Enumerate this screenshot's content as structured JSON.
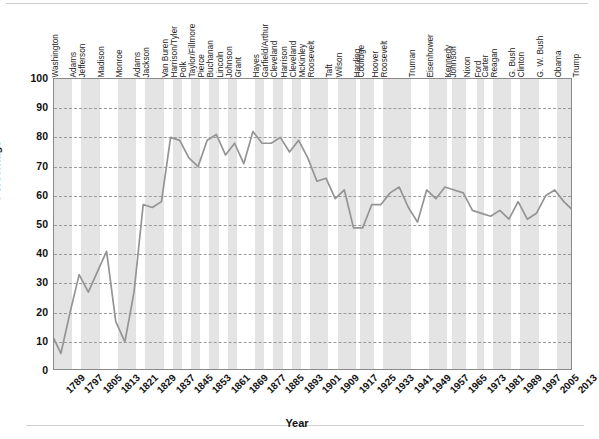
{
  "chart_data": {
    "type": "line",
    "title": "",
    "xlabel": "Year",
    "ylabel": "Percentage",
    "ylim": [
      0,
      100
    ],
    "ytick_step": 10,
    "xlim": [
      1789,
      2016
    ],
    "grid": "horizontal-dashed",
    "legend": "none",
    "line_color": "#949494",
    "band_color": "#e4e4e4",
    "ytick_labels": [
      "100",
      "90",
      "80",
      "70",
      "60",
      "50",
      "40",
      "30",
      "20",
      "10",
      "0"
    ],
    "ytick_values": [
      100,
      90,
      80,
      70,
      60,
      50,
      40,
      30,
      20,
      10,
      0
    ],
    "xtick_labels": [
      "1789",
      "1797",
      "1805",
      "1813",
      "1821",
      "1829",
      "1837",
      "1845",
      "1853",
      "1861",
      "1869",
      "1877",
      "1885",
      "1893",
      "1901",
      "1909",
      "1917",
      "1925",
      "1933",
      "1941",
      "1949",
      "1957",
      "1965",
      "1973",
      "1981",
      "1989",
      "1997",
      "2005",
      "2013"
    ],
    "xtick_values": [
      1789,
      1797,
      1805,
      1813,
      1821,
      1829,
      1837,
      1845,
      1853,
      1861,
      1869,
      1877,
      1885,
      1893,
      1901,
      1909,
      1917,
      1925,
      1933,
      1941,
      1949,
      1957,
      1965,
      1973,
      1981,
      1989,
      1997,
      2005,
      2013
    ],
    "x": [
      1789,
      1792,
      1796,
      1800,
      1804,
      1808,
      1812,
      1816,
      1820,
      1824,
      1828,
      1832,
      1836,
      1840,
      1844,
      1848,
      1852,
      1856,
      1860,
      1864,
      1868,
      1872,
      1876,
      1880,
      1884,
      1888,
      1892,
      1896,
      1900,
      1904,
      1908,
      1912,
      1916,
      1920,
      1924,
      1928,
      1932,
      1936,
      1940,
      1944,
      1948,
      1952,
      1956,
      1960,
      1964,
      1968,
      1972,
      1976,
      1980,
      1984,
      1988,
      1992,
      1996,
      2000,
      2004,
      2008,
      2012,
      2016
    ],
    "values": [
      11,
      6,
      20,
      33,
      27,
      34,
      41,
      17,
      10,
      27,
      57,
      56,
      58,
      80,
      79,
      73,
      70,
      79,
      81,
      74,
      78,
      71,
      82,
      78,
      78,
      80,
      75,
      79,
      73,
      65,
      66,
      59,
      62,
      49,
      49,
      57,
      57,
      61,
      63,
      56,
      51,
      62,
      59,
      63,
      62,
      61,
      55,
      54,
      53,
      55,
      52,
      58,
      52,
      54,
      60,
      62,
      58,
      55
    ],
    "series_name": "Voter turnout",
    "presidents": [
      {
        "name": "Washington",
        "start": 1789,
        "end": 1797
      },
      {
        "name": "Adams",
        "start": 1797,
        "end": 1801
      },
      {
        "name": "Jefferson",
        "start": 1801,
        "end": 1809
      },
      {
        "name": "Madison",
        "start": 1809,
        "end": 1817
      },
      {
        "name": "Monroe",
        "start": 1817,
        "end": 1825
      },
      {
        "name": "Adams",
        "start": 1825,
        "end": 1829
      },
      {
        "name": "Jackson",
        "start": 1829,
        "end": 1837
      },
      {
        "name": "Van Buren",
        "start": 1837,
        "end": 1841
      },
      {
        "name": "Harrison/Tyler",
        "start": 1841,
        "end": 1845
      },
      {
        "name": "Polk",
        "start": 1845,
        "end": 1849
      },
      {
        "name": "Taylor/Fillmore",
        "start": 1849,
        "end": 1853
      },
      {
        "name": "Pierce",
        "start": 1853,
        "end": 1857
      },
      {
        "name": "Buchanan",
        "start": 1857,
        "end": 1861
      },
      {
        "name": "Lincoln",
        "start": 1861,
        "end": 1865
      },
      {
        "name": "Johnson",
        "start": 1865,
        "end": 1869
      },
      {
        "name": "Grant",
        "start": 1869,
        "end": 1877
      },
      {
        "name": "Hayes",
        "start": 1877,
        "end": 1881
      },
      {
        "name": "Garfield/Arthur",
        "start": 1881,
        "end": 1885
      },
      {
        "name": "Cleveland",
        "start": 1885,
        "end": 1889
      },
      {
        "name": "Harrison",
        "start": 1889,
        "end": 1893
      },
      {
        "name": "Cleveland",
        "start": 1893,
        "end": 1897
      },
      {
        "name": "McKinley",
        "start": 1897,
        "end": 1901
      },
      {
        "name": "Roosevelt",
        "start": 1901,
        "end": 1909
      },
      {
        "name": "Taft",
        "start": 1909,
        "end": 1913
      },
      {
        "name": "Wilson",
        "start": 1913,
        "end": 1921
      },
      {
        "name": "Harding",
        "start": 1921,
        "end": 1923
      },
      {
        "name": "Coolidge",
        "start": 1923,
        "end": 1929
      },
      {
        "name": "Hoover",
        "start": 1929,
        "end": 1933
      },
      {
        "name": "Roosevelt",
        "start": 1933,
        "end": 1945
      },
      {
        "name": "Truman",
        "start": 1945,
        "end": 1953
      },
      {
        "name": "Eisenhower",
        "start": 1953,
        "end": 1961
      },
      {
        "name": "Kennedy",
        "start": 1961,
        "end": 1963
      },
      {
        "name": "Johnson",
        "start": 1963,
        "end": 1969
      },
      {
        "name": "Nixon",
        "start": 1969,
        "end": 1974
      },
      {
        "name": "Ford",
        "start": 1974,
        "end": 1977
      },
      {
        "name": "Carter",
        "start": 1977,
        "end": 1981
      },
      {
        "name": "Reagan",
        "start": 1981,
        "end": 1989
      },
      {
        "name": "G. Bush",
        "start": 1989,
        "end": 1993
      },
      {
        "name": "Clinton",
        "start": 1993,
        "end": 2001
      },
      {
        "name": "G. W. Bush",
        "start": 2001,
        "end": 2009
      },
      {
        "name": "Obama",
        "start": 2009,
        "end": 2017
      },
      {
        "name": "Trump",
        "start": 2017,
        "end": 2021
      }
    ]
  }
}
